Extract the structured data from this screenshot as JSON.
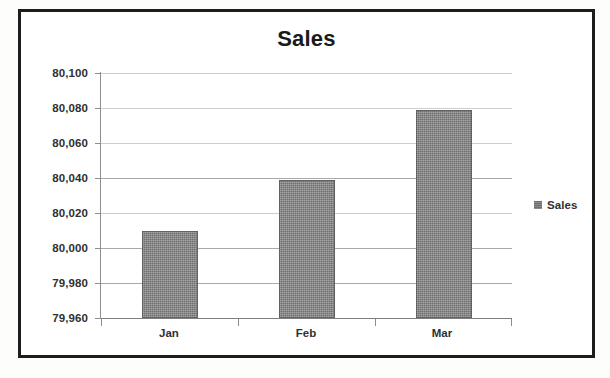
{
  "chart_data": {
    "type": "bar",
    "title": "Sales",
    "categories": [
      "Jan",
      "Feb",
      "Mar"
    ],
    "values": [
      80010,
      80039,
      80079
    ],
    "series": [
      {
        "name": "Sales",
        "values": [
          80010,
          80039,
          80079
        ]
      }
    ],
    "xlabel": "",
    "ylabel": "",
    "ylim": [
      79960,
      80100
    ],
    "y_tick_step": 20,
    "y_tick_labels": [
      "80,100",
      "80,080",
      "80,060",
      "80,040",
      "80,020",
      "80,000",
      "79,980",
      "79,960"
    ],
    "y_tick_values": [
      80100,
      80080,
      80060,
      80040,
      80020,
      80000,
      79980,
      79960
    ],
    "grid": true,
    "legend": {
      "position": "right",
      "entries": [
        {
          "label": "Sales",
          "color": "#6e6e6e",
          "marker": "square-swatch"
        }
      ]
    },
    "colors": {
      "bar": "#6e6e6e",
      "gridline": "#9a9a9a",
      "axis": "#8e8e8e",
      "text": "#303030",
      "frame_border": "#1d1d1d",
      "plot_background": "#ffffff"
    }
  },
  "legend": {
    "label": "Sales"
  }
}
